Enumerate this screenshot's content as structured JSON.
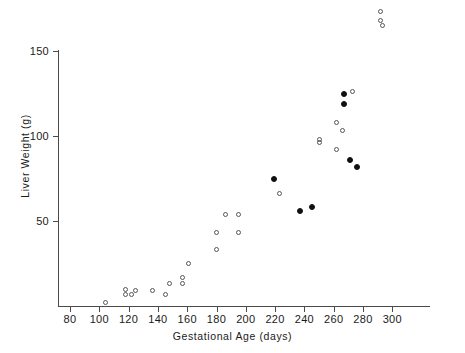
{
  "chart_data": {
    "type": "scatter",
    "title": "",
    "xlabel": "Gestational Age (days)",
    "ylabel": "Liver Weight (g)",
    "xlim": [
      70,
      302
    ],
    "ylim": [
      0,
      172
    ],
    "xticks": [
      80,
      100,
      120,
      140,
      160,
      180,
      200,
      220,
      240,
      260,
      280,
      300
    ],
    "yticks": [
      50,
      100,
      150
    ],
    "xtick_labels": [
      "80",
      "100",
      "120",
      "140",
      "160",
      "180",
      "200",
      "220",
      "240",
      "260",
      "280",
      "300"
    ],
    "ytick_labels": [
      "50",
      "100",
      "150"
    ],
    "grid": false,
    "legend": null,
    "series": [
      {
        "name": "open-circle",
        "marker": "open circle",
        "color": "#555555",
        "points": [
          {
            "x": 104,
            "y": 2
          },
          {
            "x": 118,
            "y": 10
          },
          {
            "x": 118,
            "y": 7
          },
          {
            "x": 122,
            "y": 7
          },
          {
            "x": 125,
            "y": 9
          },
          {
            "x": 136,
            "y": 9
          },
          {
            "x": 145,
            "y": 7
          },
          {
            "x": 148,
            "y": 13
          },
          {
            "x": 157,
            "y": 17
          },
          {
            "x": 157,
            "y": 13
          },
          {
            "x": 161,
            "y": 25
          },
          {
            "x": 180,
            "y": 33
          },
          {
            "x": 180,
            "y": 43
          },
          {
            "x": 186,
            "y": 54
          },
          {
            "x": 195,
            "y": 43
          },
          {
            "x": 195,
            "y": 54
          },
          {
            "x": 223,
            "y": 66
          },
          {
            "x": 250,
            "y": 98
          },
          {
            "x": 250,
            "y": 96
          },
          {
            "x": 262,
            "y": 108
          },
          {
            "x": 266,
            "y": 103
          },
          {
            "x": 262,
            "y": 92
          },
          {
            "x": 273,
            "y": 126
          },
          {
            "x": 292,
            "y": 173
          },
          {
            "x": 292,
            "y": 168
          },
          {
            "x": 293,
            "y": 165
          }
        ]
      },
      {
        "name": "filled-circle",
        "marker": "filled circle",
        "color": "#111111",
        "points": [
          {
            "x": 219,
            "y": 75
          },
          {
            "x": 237,
            "y": 56
          },
          {
            "x": 245,
            "y": 58
          },
          {
            "x": 267,
            "y": 125
          },
          {
            "x": 267,
            "y": 119
          },
          {
            "x": 271,
            "y": 86
          },
          {
            "x": 276,
            "y": 82
          }
        ]
      }
    ]
  }
}
